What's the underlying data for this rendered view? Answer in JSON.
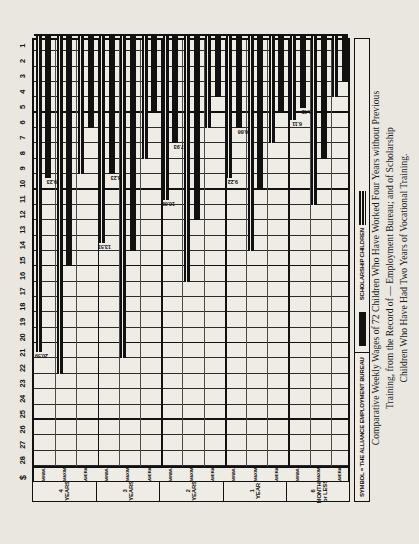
{
  "caption": {
    "line1": "Comparative Weekly Wages of 72 Children Who Have Worked Four Years without Previous",
    "line2": "Training, from the Record of — Employment Bureau; and of Scholarship",
    "line3": "Children Who Have Had Two Years of Vocational Training."
  },
  "legend": {
    "symbol_note": "SYMBOL = THE ALLIANCE EMPLOYMENT BUREAU",
    "entries": [
      {
        "label": "SCHOLARSHIP CHILDREN",
        "swatch": "striped",
        "color": "#111111"
      },
      {
        "label": "",
        "swatch": "solid",
        "color": "#111111"
      }
    ]
  },
  "axis": {
    "currency_symbol": "$",
    "ticks": [
      1,
      2,
      3,
      4,
      5,
      6,
      7,
      8,
      9,
      10,
      11,
      12,
      13,
      14,
      15,
      16,
      17,
      18,
      19,
      20,
      21,
      22,
      23,
      24,
      25,
      26,
      27,
      28
    ],
    "stat_labels": [
      "MINIMUM",
      "MAXIMUM",
      "AVERAGE"
    ],
    "groups": [
      "6 MONTHS or LESS",
      "1 YEAR",
      "2 YEARS",
      "3 YEARS",
      "4 YEARS"
    ]
  },
  "chart_data": {
    "type": "bar",
    "xlabel": "Weekly wage in dollars",
    "ylabel": "Length of employment",
    "xlim": [
      0,
      28
    ],
    "grid": true,
    "orientation": "horizontal",
    "legend_position": "bottom",
    "categories": [
      "6 MONTHS or LESS — MINIMUM",
      "6 MONTHS or LESS — MAXIMUM",
      "6 MONTHS or LESS — AVERAGE",
      "1 YEAR — MINIMUM",
      "1 YEAR — MAXIMUM",
      "1 YEAR — AVERAGE",
      "2 YEARS — MINIMUM",
      "2 YEARS — MAXIMUM",
      "2 YEARS — AVERAGE",
      "3 YEARS — MINIMUM",
      "3 YEARS — MAXIMUM",
      "3 YEARS — AVERAGE",
      "4 YEARS — MINIMUM",
      "4 YEARS — MAXIMUM",
      "4 YEARS — AVERAGE"
    ],
    "series": [
      {
        "name": "SCHOLARSHIP CHILDREN",
        "pattern": "striped",
        "color": "#111111",
        "values": [
          4.0,
          11.0,
          5.48,
          7.0,
          14.0,
          9.22,
          6.0,
          16.0,
          10.69,
          8.0,
          21.0,
          13.51,
          9.0,
          22.0,
          20.59
        ]
      },
      {
        "name": "THE ALLIANCE EMPLOYMENT BUREAU",
        "pattern": "solid",
        "color": "#111111",
        "values": [
          3.0,
          8.0,
          4.66,
          5.0,
          10.0,
          6.0,
          4.0,
          12.0,
          7.0,
          5.0,
          14.0,
          9.0,
          6.0,
          15.0,
          9.23
        ]
      }
    ],
    "annotations": [
      {
        "category": "4 YEARS — AVERAGE",
        "series": "SCHOLARSHIP CHILDREN",
        "value": "20.59"
      },
      {
        "category": "4 YEARS — AVERAGE",
        "series": "THE ALLIANCE EMPLOYMENT BUREAU",
        "value": "9.23"
      },
      {
        "category": "3 YEARS — AVERAGE",
        "series": "SCHOLARSHIP CHILDREN",
        "value": "13.51"
      },
      {
        "category": "3 YEARS — AVERAGE",
        "series": "THE ALLIANCE EMPLOYMENT BUREAU",
        "value": "8.23"
      },
      {
        "category": "2 YEARS — AVERAGE",
        "series": "SCHOLARSHIP CHILDREN",
        "value": "10.69"
      },
      {
        "category": "2 YEARS — AVERAGE",
        "series": "THE ALLIANCE EMPLOYMENT BUREAU",
        "value": "7.93"
      },
      {
        "category": "1 YEAR — AVERAGE",
        "series": "SCHOLARSHIP CHILDREN",
        "value": "9.22"
      },
      {
        "category": "1 YEAR — AVERAGE",
        "series": "THE ALLIANCE EMPLOYMENT BUREAU",
        "value": "6.66"
      },
      {
        "category": "6 MONTHS or LESS — AVERAGE",
        "series": "SCHOLARSHIP CHILDREN",
        "value": "6.11"
      },
      {
        "category": "6 MONTHS or LESS — AVERAGE",
        "series": "THE ALLIANCE EMPLOYMENT BUREAU",
        "value": "5.48"
      }
    ]
  }
}
